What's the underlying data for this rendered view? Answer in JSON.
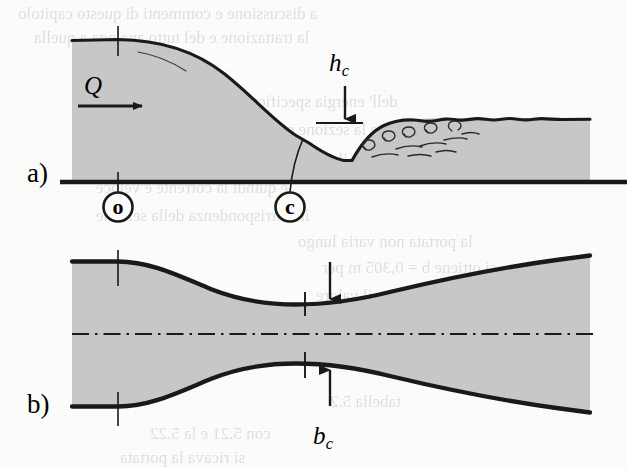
{
  "figure": {
    "panels": [
      {
        "tag": "a)",
        "name": "longitudinal-profile",
        "description": "Free-surface profile along the channel: drawdown through the constriction to critical depth, followed by a hydraulic jump downstream."
      },
      {
        "tag": "b)",
        "name": "plan-view",
        "description": "Plan view of the channel walls converging to the critical width at the throat, then diverging downstream."
      }
    ],
    "labels": {
      "discharge": {
        "symbol": "Q",
        "sub": ""
      },
      "critical_depth": {
        "symbol": "h",
        "sub": "c"
      },
      "critical_width": {
        "symbol": "b",
        "sub": "c"
      }
    },
    "section_markers": [
      {
        "id": "o",
        "label": "o",
        "description": "approach section"
      },
      {
        "id": "c",
        "label": "c",
        "description": "critical / throat section"
      }
    ],
    "colors": {
      "water_fill": "#c9c9c9",
      "ink": "#1a1a1a",
      "paper": "#fdfdfc"
    },
    "annotations": {
      "flow_arrow": "right-arrow",
      "hc_arrow": "down-arrow",
      "bc_arrow": "up-arrow",
      "centerline": "dash-dot",
      "jump_rollers": "turbulent-eddies"
    }
  },
  "ghost_text": {
    "note": "Faint mirrored bleed-through from the reverse side of the scanned page.",
    "lines": [
      {
        "text": "a discussione e commenti di questo capitolo",
        "x": 18,
        "y": 4,
        "size": 17
      },
      {
        "text": "la trattazione e del tutto analoga a quella",
        "x": 34,
        "y": 28,
        "size": 17
      },
      {
        "text": "dell' energia specifica e della portata",
        "x": 150,
        "y": 92,
        "size": 17
      },
      {
        "text": "mentre la sezione critica e quella in cui",
        "x": 152,
        "y": 120,
        "size": 17
      },
      {
        "text": "il numero di Froude vale uno",
        "x": 150,
        "y": 150,
        "size": 17
      },
      {
        "text": "e quindi la corrente e veloce",
        "x": 96,
        "y": 178,
        "size": 17
      },
      {
        "text": "in corrispondenza della sezione",
        "x": 96,
        "y": 206,
        "size": 17
      },
      {
        "text": "la portata non varia lungo",
        "x": 298,
        "y": 232,
        "size": 17
      },
      {
        "text": "si ottiene b = 0,305 m per",
        "x": 322,
        "y": 258,
        "size": 17
      },
      {
        "text": "da cui risulta che il valore",
        "x": 316,
        "y": 286,
        "size": 17
      },
      {
        "text": "e la sezione critica",
        "x": 318,
        "y": 312,
        "size": 17
      },
      {
        "text": "tabella 5.2",
        "x": 330,
        "y": 392,
        "size": 17
      },
      {
        "text": "con 5.21 e la 5.22",
        "x": 150,
        "y": 424,
        "size": 17
      },
      {
        "text": "si ricava la portata",
        "x": 120,
        "y": 448,
        "size": 17
      }
    ]
  }
}
